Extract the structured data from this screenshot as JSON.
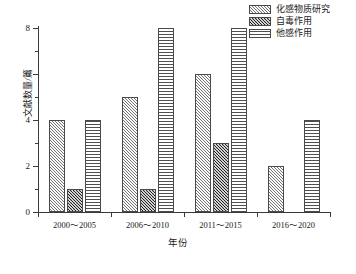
{
  "chart_data": {
    "type": "bar",
    "title": "",
    "subtitle": "",
    "xlabel": "年份",
    "ylabel": "文献数量/篇",
    "categories": [
      "2000～2005",
      "2006～2010",
      "2011～2015",
      "2016～2020"
    ],
    "series": [
      {
        "name": "化感物质研究",
        "values": [
          4,
          5,
          6,
          2
        ],
        "pattern": "diagonal-hatch",
        "color": "#b9b9b9"
      },
      {
        "name": "自毒作用",
        "values": [
          1,
          1,
          3,
          0
        ],
        "pattern": "dark-crosshatch",
        "color": "#585858"
      },
      {
        "name": "他感作用",
        "values": [
          4,
          8,
          8,
          4
        ],
        "pattern": "horizontal-lines",
        "color": "#f2f2f2"
      }
    ],
    "ylim": [
      0,
      8
    ],
    "y_major_ticks": [
      0,
      2,
      4,
      6,
      8
    ],
    "y_minor_ticks": [
      1,
      3,
      5,
      7
    ],
    "y_tick_labels": [
      "0",
      "2",
      "4",
      "6",
      "8"
    ],
    "grid": false,
    "legend_position": "top-right-outside"
  },
  "axes": {
    "y_labels": [
      "8",
      "6",
      "4",
      "2",
      "0"
    ],
    "x_labels": [
      "2000～2005",
      "2006～2010",
      "2011～2015",
      "2016～2020"
    ],
    "y_title": "文献数量/篇",
    "x_title": "年份"
  },
  "legend": {
    "items": [
      {
        "label": "化感物质研究"
      },
      {
        "label": "自毒作用"
      },
      {
        "label": "他感作用"
      }
    ]
  }
}
